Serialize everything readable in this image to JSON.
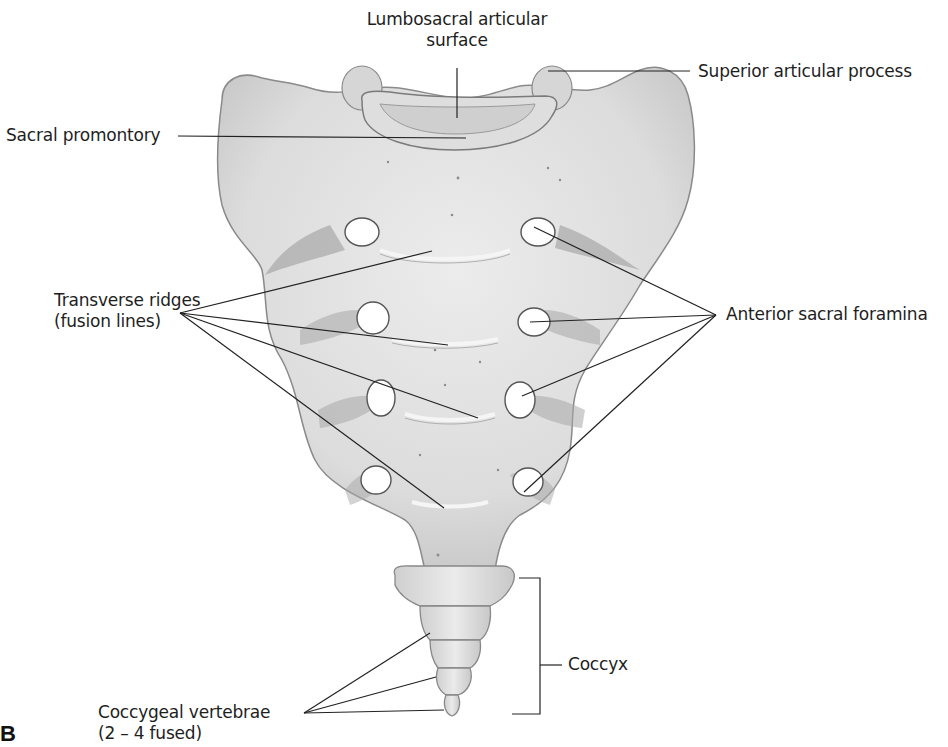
{
  "figure": {
    "panel_letter": "B",
    "colors": {
      "bone": "#e2e2e2",
      "bone_shadow": "#9a9a9a",
      "line": "#222222",
      "background": "#ffffff"
    }
  },
  "labels": {
    "lumbosacral": {
      "line1": "Lumbosacral articular",
      "line2": "surface"
    },
    "superior_articular_process": "Superior articular process",
    "sacral_promontory": "Sacral promontory",
    "transverse_ridges": {
      "line1": "Transverse ridges",
      "line2": "(fusion lines)"
    },
    "anterior_sacral_foramina": "Anterior sacral foramina",
    "coccyx": "Coccyx",
    "coccygeal_vertebrae": {
      "line1": "Coccygeal vertebrae",
      "line2": "(2 – 4 fused)"
    }
  }
}
